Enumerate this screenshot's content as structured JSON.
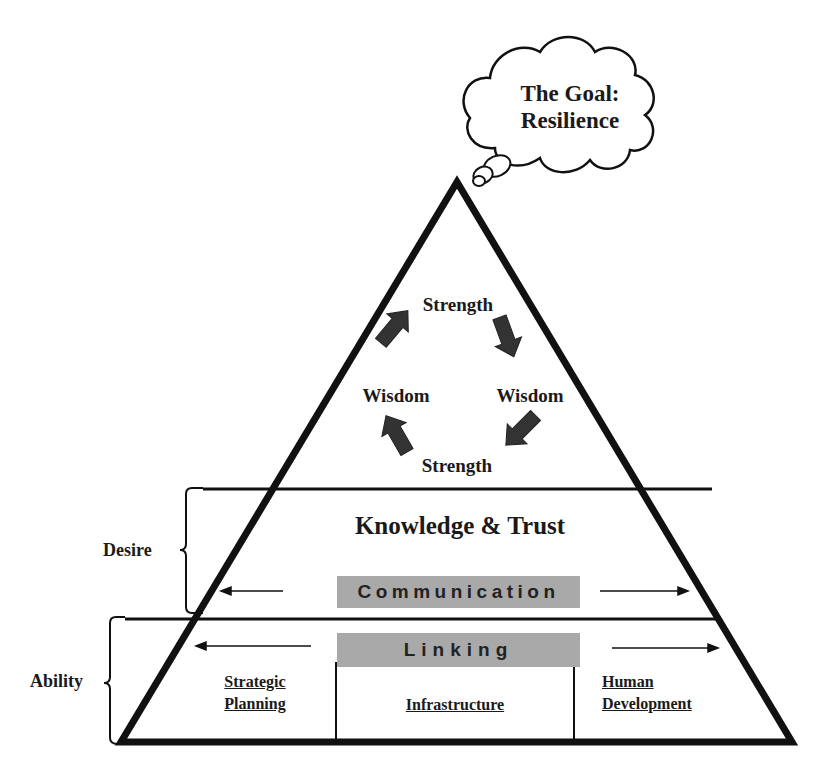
{
  "goal": {
    "line1": "The Goal:",
    "line2": "Resilience"
  },
  "cycle": {
    "top": "Strength",
    "right": "Wisdom",
    "bottom": "Strength",
    "left": "Wisdom"
  },
  "middle_tier": {
    "title": "Knowledge & Trust",
    "bar_label": "Communication"
  },
  "bottom_tier": {
    "bar_label": "Linking",
    "columns": [
      {
        "line1": "Strategic",
        "line2": "Planning"
      },
      {
        "line1": "Infrastructure"
      },
      {
        "line1": "Human",
        "line2": "Development"
      }
    ]
  },
  "brackets": {
    "desire": "Desire",
    "ability": "Ability"
  },
  "colors": {
    "outline": "#111111",
    "bar_fill": "#a9a9a9",
    "arrow_fill": "#333333"
  }
}
